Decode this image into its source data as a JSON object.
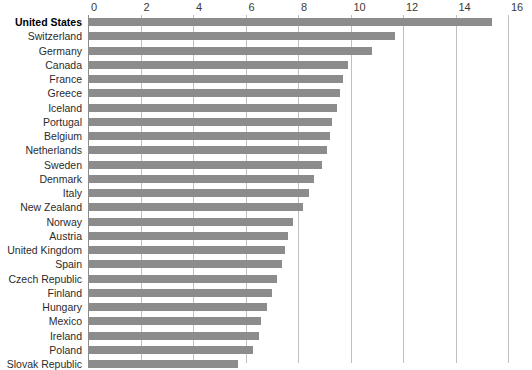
{
  "chart_data": {
    "type": "bar",
    "orientation": "horizontal",
    "title": "",
    "subtitle": "",
    "xlabel": "",
    "ylabel": "",
    "xlim": [
      0,
      16
    ],
    "xticks": [
      0,
      2,
      4,
      6,
      8,
      10,
      12,
      14,
      16
    ],
    "xtick_labels": [
      "0",
      "2",
      "4",
      "6",
      "8",
      "10",
      "12",
      "14",
      "16"
    ],
    "grid": true,
    "legend": "none",
    "bar_color": "#8c8c8c",
    "gridline_color": "#bfbfbf",
    "highlight_category": "United States",
    "categories": [
      "United States",
      "Switzerland",
      "Germany",
      "Canada",
      "France",
      "Greece",
      "Iceland",
      "Portugal",
      "Belgium",
      "Netherlands",
      "Sweden",
      "Denmark",
      "Italy",
      "New Zealand",
      "Norway",
      "Austria",
      "United Kingdom",
      "Spain",
      "Czech Republic",
      "Finland",
      "Hungary",
      "Mexico",
      "Ireland",
      "Poland",
      "Slovak Republic"
    ],
    "values": [
      15.4,
      11.7,
      10.8,
      9.9,
      9.7,
      9.6,
      9.5,
      9.3,
      9.2,
      9.1,
      8.9,
      8.6,
      8.4,
      8.2,
      7.8,
      7.6,
      7.5,
      7.4,
      7.2,
      7.0,
      6.8,
      6.6,
      6.5,
      6.3,
      5.7
    ]
  }
}
